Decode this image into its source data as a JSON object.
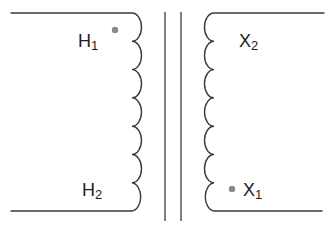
{
  "diagram": {
    "type": "transformer-schematic",
    "primary": {
      "terminal_top": {
        "letter": "H",
        "subscript": "1"
      },
      "terminal_bottom": {
        "letter": "H",
        "subscript": "2"
      },
      "polarity_dot": "top",
      "turns": 7
    },
    "secondary": {
      "terminal_top": {
        "letter": "X",
        "subscript": "2"
      },
      "terminal_bottom": {
        "letter": "X",
        "subscript": "1"
      },
      "polarity_dot": "bottom",
      "turns": 7
    },
    "core": {
      "lines": 2
    },
    "colors": {
      "wire": "#3a3a3a",
      "dot": "#8a8a8a",
      "text": "#1e1e1e"
    }
  }
}
